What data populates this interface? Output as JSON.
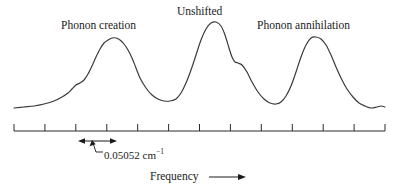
{
  "figure": {
    "background_color": "#ffffff",
    "curve_color": "#3a3a3a",
    "axis_color": "#2a2a2a"
  },
  "labels": {
    "phonon_creation": "Phonon creation",
    "unshifted": "Unshifted",
    "phonon_annihilation": "Phonon annihilation"
  },
  "annotation": {
    "value": "0.05052 cm",
    "exponent": "−1"
  },
  "axis": {
    "title": "Frequency",
    "arrow_icon": "right-arrow-icon"
  },
  "chart_data": {
    "type": "line",
    "title": "",
    "xlabel": "Frequency",
    "ylabel": "",
    "grid": false,
    "legend": null,
    "axis_ticks_count": 12,
    "annotations": [
      {
        "text": "0.05052 cm−1",
        "kind": "span-measure",
        "description": "Double-headed arrow spanning one tick interval below the first phonon creation peak"
      },
      {
        "text": "Phonon creation",
        "kind": "peak-label",
        "peak_index": 0
      },
      {
        "text": "Unshifted",
        "kind": "peak-label",
        "peak_index": 1
      },
      {
        "text": "Phonon annihilation",
        "kind": "peak-label",
        "peak_index": 2
      }
    ],
    "peaks": [
      {
        "name": "Phonon creation",
        "x": 110,
        "height": 0.8,
        "note": "shoulder on low-frequency side"
      },
      {
        "name": "Unshifted",
        "x": 210,
        "height": 1.0,
        "note": "shoulder on high-frequency side"
      },
      {
        "name": "Phonon annihilation",
        "x": 310,
        "height": 0.82
      }
    ],
    "x": [
      14,
      24,
      34,
      44,
      54,
      62,
      68,
      72,
      76,
      80,
      84,
      88,
      92,
      96,
      100,
      104,
      108,
      112,
      116,
      120,
      124,
      128,
      132,
      136,
      140,
      146,
      152,
      158,
      164,
      170,
      176,
      181,
      186,
      191,
      196,
      201,
      206,
      211,
      216,
      221,
      225,
      229,
      232,
      235,
      238,
      242,
      247,
      252,
      258,
      264,
      270,
      276,
      281,
      286,
      291,
      296,
      301,
      306,
      311,
      316,
      321,
      326,
      331,
      336,
      341,
      347,
      353,
      359,
      365,
      371,
      377,
      381,
      385
    ],
    "y": [
      108,
      107,
      106,
      104,
      101,
      97,
      93,
      89,
      85,
      83,
      80,
      74,
      66,
      57,
      49,
      43,
      40,
      38,
      38,
      40,
      44,
      50,
      58,
      68,
      78,
      88,
      95,
      99,
      101,
      101,
      99,
      93,
      83,
      70,
      55,
      40,
      29,
      23,
      22,
      26,
      35,
      48,
      57,
      62,
      63,
      65,
      72,
      82,
      92,
      99,
      103,
      104,
      102,
      96,
      86,
      72,
      57,
      45,
      38,
      37,
      39,
      45,
      55,
      67,
      78,
      89,
      97,
      103,
      106,
      108,
      107,
      106,
      107
    ],
    "ylim": [
      115,
      15
    ],
    "xlim": [
      14,
      385
    ],
    "baseline_y": 108
  }
}
